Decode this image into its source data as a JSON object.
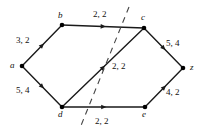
{
  "figure": {
    "type": "flow-network-diagram",
    "background_color": "#ffffff",
    "edge_color": "#1a1a1a",
    "node_color": "#000000",
    "cut_color": "#444444",
    "label_format": "capacity, flow"
  },
  "nodes": [
    {
      "id": "a",
      "label": "a",
      "x": 22,
      "y": 66,
      "label_x": 10,
      "label_y": 61
    },
    {
      "id": "b",
      "label": "b",
      "x": 62,
      "y": 25,
      "label_x": 58,
      "label_y": 11
    },
    {
      "id": "c",
      "label": "c",
      "x": 144,
      "y": 28,
      "label_x": 141,
      "label_y": 13
    },
    {
      "id": "d",
      "label": "d",
      "x": 62,
      "y": 107,
      "label_x": 58,
      "label_y": 110
    },
    {
      "id": "e",
      "label": "e",
      "x": 145,
      "y": 107,
      "label_x": 142,
      "label_y": 110
    },
    {
      "id": "z",
      "label": "z",
      "x": 183,
      "y": 68,
      "label_x": 190,
      "label_y": 63
    }
  ],
  "edges": [
    {
      "id": "a-b",
      "from": "a",
      "to": "b",
      "label": "3, 2",
      "capacity": 3,
      "flow": 2,
      "label_x": 16,
      "label_y": 36
    },
    {
      "id": "a-d",
      "from": "a",
      "to": "d",
      "label": "5, 4",
      "capacity": 5,
      "flow": 4,
      "label_x": 16,
      "label_y": 86
    },
    {
      "id": "b-c",
      "from": "b",
      "to": "c",
      "label": "2, 2",
      "capacity": 2,
      "flow": 2,
      "label_x": 93,
      "label_y": 10
    },
    {
      "id": "d-c",
      "from": "d",
      "to": "c",
      "label": "2, 2",
      "capacity": 2,
      "flow": 2,
      "label_x": 112,
      "label_y": 62
    },
    {
      "id": "d-e",
      "from": "d",
      "to": "e",
      "label": "2, 2",
      "capacity": 2,
      "flow": 2,
      "label_x": 95,
      "label_y": 117
    },
    {
      "id": "c-z",
      "from": "c",
      "to": "z",
      "label": "5, 4",
      "capacity": 5,
      "flow": 4,
      "label_x": 166,
      "label_y": 39
    },
    {
      "id": "e-z",
      "from": "e",
      "to": "z",
      "label": "4, 2",
      "capacity": 4,
      "flow": 2,
      "label_x": 166,
      "label_y": 88
    }
  ],
  "cut": {
    "id": "cut-line",
    "style": "dashed",
    "x1": 129,
    "y1": 7,
    "x2": 80,
    "y2": 128
  }
}
